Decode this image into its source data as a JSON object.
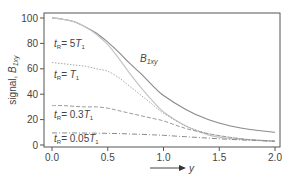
{
  "chart_data": {
    "type": "line",
    "title": "",
    "xlabel": "y",
    "ylabel": "signal, B1xy",
    "xlim": [
      0.0,
      2.0
    ],
    "ylim": [
      0,
      100
    ],
    "xticks": [
      "0.0",
      "0.5",
      "1.0",
      "1.5",
      "2.0"
    ],
    "yticks": [
      "0",
      "20",
      "40",
      "60",
      "80",
      "100"
    ],
    "grid": false,
    "x": [
      0.0,
      0.1,
      0.2,
      0.3,
      0.4,
      0.5,
      0.6,
      0.7,
      0.8,
      0.9,
      1.0,
      1.2,
      1.4,
      1.6,
      1.8,
      2.0
    ],
    "series": [
      {
        "name": "B1xy",
        "style": "solid-dark",
        "values": [
          100,
          99,
          97,
          93,
          88,
          81,
          73,
          64,
          56,
          47,
          39,
          28,
          20,
          15,
          12,
          10
        ]
      },
      {
        "name": "tR = 5T1",
        "style": "solid-light",
        "values": [
          100,
          99,
          97,
          93,
          87,
          79,
          68,
          56,
          45,
          35,
          26,
          15,
          8,
          5,
          4,
          3
        ]
      },
      {
        "name": "tR = T1",
        "style": "dotted",
        "values": [
          65,
          64,
          63,
          62,
          60,
          58,
          53,
          46,
          39,
          32,
          25,
          15,
          9,
          6,
          4,
          3
        ]
      },
      {
        "name": "tR = 0.3T1",
        "style": "dashed",
        "values": [
          31,
          31,
          30.5,
          30,
          30,
          29,
          27,
          25,
          23,
          21,
          19,
          13,
          9,
          6,
          4,
          3
        ]
      },
      {
        "name": "tR = 0.05T1",
        "style": "dash-dot",
        "values": [
          9.5,
          9.5,
          9.5,
          9.4,
          9.3,
          9.2,
          9.0,
          8.7,
          8.4,
          8.0,
          7.6,
          6.5,
          5.4,
          4.4,
          3.6,
          3.0
        ]
      }
    ],
    "annotations": [
      {
        "text": "B1xy",
        "x": 0.82,
        "y": 66
      },
      {
        "text": "tR = 5T1",
        "x": 0.02,
        "y": 78
      },
      {
        "text": "tR = T1",
        "x": 0.02,
        "y": 55
      },
      {
        "text": "tR = 0.3T1",
        "x": 0.02,
        "y": 22
      },
      {
        "text": "tR = 0.05T1",
        "x": 0.02,
        "y": 4
      }
    ],
    "legend": "inline annotations"
  },
  "labels": {
    "ylabel_main": "signal, ",
    "ylabel_var": "B",
    "ylabel_sub": "1xy",
    "xlabel": "y",
    "b1xy_main": "B",
    "b1xy_sub": "1xy",
    "tr5": {
      "pre": "t",
      "sub": "R",
      "eq": "= 5",
      "t": "T",
      "tsub": "1"
    },
    "tr1": {
      "pre": "t",
      "sub": "R",
      "eq": "= ",
      "t": "T",
      "tsub": "1"
    },
    "tr03": {
      "pre": "t",
      "sub": "R",
      "eq": "= 0.3",
      "t": "T",
      "tsub": "1"
    },
    "tr005": {
      "pre": "t",
      "sub": "R",
      "eq": "= 0.05",
      "t": "T",
      "tsub": "1"
    }
  },
  "colors": {
    "axis": "#555555",
    "b1xy": "#8a8a8a",
    "tr5": "#c4c4c4",
    "tr1": "#a8a8a8",
    "tr03": "#9a9a9a",
    "tr005": "#8a8a8a"
  }
}
